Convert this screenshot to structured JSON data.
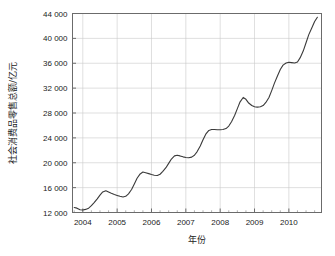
{
  "chart_data": {
    "type": "line",
    "title": "",
    "xlabel": "年份",
    "ylabel": "社会消费品零售总额/亿元",
    "xlim": [
      2003.7,
      2010.95
    ],
    "ylim": [
      12000,
      44000
    ],
    "grid": true,
    "legend": null,
    "x_tick_labels": [
      "2004",
      "2005",
      "2006",
      "2007",
      "2008",
      "2009",
      "2010"
    ],
    "x_ticks": [
      2004,
      2005,
      2006,
      2007,
      2008,
      2009,
      2010
    ],
    "y_tick_labels": [
      "12 000",
      "16 000",
      "20 000",
      "24 000",
      "28 000",
      "32 000",
      "36 000",
      "40 000",
      "44 000"
    ],
    "y_ticks": [
      12000,
      16000,
      20000,
      24000,
      28000,
      32000,
      36000,
      40000,
      44000
    ],
    "x_minor_ticks_per_interval": 4,
    "series": [
      {
        "name": "社会消费品零售总额",
        "color": "#3a3a3a",
        "x": [
          2003.75,
          2003.83,
          2003.92,
          2004.0,
          2004.08,
          2004.17,
          2004.25,
          2004.33,
          2004.42,
          2004.5,
          2004.58,
          2004.67,
          2004.75,
          2004.83,
          2004.92,
          2005.0,
          2005.08,
          2005.17,
          2005.25,
          2005.33,
          2005.42,
          2005.5,
          2005.58,
          2005.67,
          2005.75,
          2005.83,
          2005.92,
          2006.0,
          2006.08,
          2006.17,
          2006.25,
          2006.33,
          2006.42,
          2006.5,
          2006.58,
          2006.67,
          2006.75,
          2006.83,
          2006.92,
          2007.0,
          2007.08,
          2007.17,
          2007.25,
          2007.33,
          2007.42,
          2007.5,
          2007.58,
          2007.67,
          2007.75,
          2007.83,
          2007.92,
          2008.0,
          2008.08,
          2008.17,
          2008.25,
          2008.33,
          2008.42,
          2008.5,
          2008.58,
          2008.67,
          2008.75,
          2008.83,
          2008.92,
          2009.0,
          2009.08,
          2009.17,
          2009.25,
          2009.33,
          2009.42,
          2009.5,
          2009.58,
          2009.67,
          2009.75,
          2009.83,
          2009.92,
          2010.0,
          2010.08,
          2010.17,
          2010.25,
          2010.33,
          2010.42,
          2010.5,
          2010.58,
          2010.67,
          2010.75,
          2010.83
        ],
        "y": [
          12800,
          12700,
          12450,
          12400,
          12500,
          12700,
          13100,
          13600,
          14200,
          14800,
          15300,
          15500,
          15300,
          15100,
          14900,
          14750,
          14600,
          14500,
          14600,
          15000,
          15700,
          16600,
          17500,
          18200,
          18500,
          18400,
          18250,
          18100,
          18000,
          17950,
          18150,
          18600,
          19200,
          19900,
          20600,
          21100,
          21200,
          21100,
          20950,
          20850,
          20800,
          20900,
          21200,
          21800,
          22700,
          23700,
          24600,
          25200,
          25350,
          25350,
          25300,
          25300,
          25350,
          25500,
          25900,
          26600,
          27600,
          28700,
          29800,
          30500,
          30200,
          29600,
          29200,
          29000,
          28950,
          29000,
          29200,
          29700,
          30500,
          31600,
          32800,
          34000,
          35000,
          35700,
          36050,
          36150,
          36100,
          36050,
          36200,
          36900,
          38000,
          39300,
          40600,
          41700,
          42700,
          43400
        ]
      }
    ],
    "annotations": []
  },
  "axes": {
    "y_axis_title": "社会消费品零售总额/亿元",
    "x_axis_title": "年份"
  },
  "colors": {
    "line": "#3a3a3a",
    "grid": "#c9c9c9",
    "frame": "#6b6b6b",
    "background": "#ffffff",
    "text": "#222222"
  }
}
